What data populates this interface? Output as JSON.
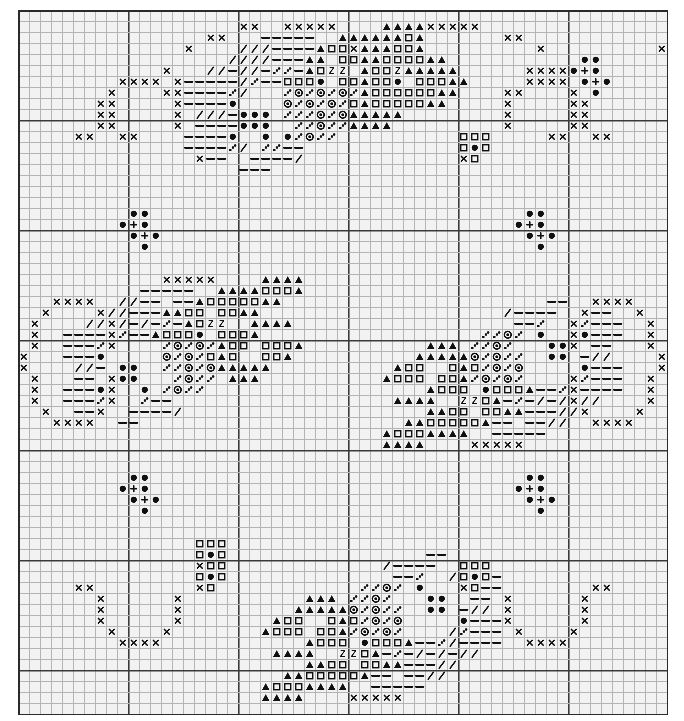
{
  "document": {
    "type": "cross-stitch-pattern-chart",
    "title": "Cross Stitch Pattern Chart",
    "description": "Monochrome counted cross stitch grid chart with four-fold symmetric rose and berry motifs"
  },
  "grid": {
    "columns": 59,
    "rows": 64,
    "cell_px": 11,
    "origin_x_px": 18,
    "origin_y_px": 10,
    "bold_every": 10,
    "background_color": "#f2f2f2",
    "thin_line_color": "#b4b4b4",
    "bold_line_color": "#3a3a3a",
    "symbol_color": "#101010",
    "border_color": "#2a2a2a"
  },
  "legend": {
    "symbols": [
      {
        "key": "x",
        "name": "cross-x-symbol",
        "glyph": "×",
        "meaning": "backstitch outline / light shade"
      },
      {
        "key": "o",
        "name": "filled-circle-symbol",
        "glyph": "●",
        "meaning": "dark berry / bud"
      },
      {
        "key": "p",
        "name": "plus-symbol",
        "glyph": "+",
        "meaning": "berry highlight"
      },
      {
        "key": "s",
        "name": "open-square-symbol",
        "glyph": "□",
        "meaning": "petal mid tone"
      },
      {
        "key": "t",
        "name": "filled-triangle-symbol",
        "glyph": "▲",
        "meaning": "petal dark tone"
      },
      {
        "key": "z",
        "name": "letter-z-symbol",
        "glyph": "Z",
        "meaning": "petal accent"
      },
      {
        "key": "d",
        "name": "dotted-circle-symbol",
        "glyph": "◎",
        "meaning": "leaf texture"
      },
      {
        "key": "q",
        "name": "quarter-dot-symbol",
        "glyph": "∴",
        "meaning": "quarter stitch"
      },
      {
        "key": "-",
        "name": "dash-symbol",
        "glyph": "—",
        "meaning": "leaf light tone"
      },
      {
        "key": "/",
        "name": "slash-symbol",
        "glyph": "/",
        "meaning": "stem / vein"
      }
    ]
  },
  "chart_data": {
    "type": "heatmap",
    "xlabel": "column",
    "ylabel": "row",
    "grid_on": true,
    "legend_position": "none",
    "columns": 59,
    "rows": 64,
    "symbol_counts": {
      "x": 196,
      "o": 120,
      "p": 16,
      "s": 132,
      "t": 176,
      "z": 8,
      "d": 96,
      "q": 120,
      "dash": 176,
      "slash": 92
    },
    "cells": [
      {
        "r": 1,
        "c": 37,
        "s": "x"
      },
      {
        "r": 1,
        "c": 38,
        "s": "x"
      },
      {
        "r": 1,
        "c": 39,
        "s": "x"
      },
      {
        "r": 1,
        "c": 40,
        "s": "x"
      },
      {
        "r": 1,
        "c": 41,
        "s": "x"
      },
      {
        "r": 1,
        "c": 20,
        "s": "x"
      },
      {
        "r": 1,
        "c": 21,
        "s": "x"
      },
      {
        "r": 2,
        "c": 23,
        "s": "-"
      },
      {
        "r": 2,
        "c": 24,
        "s": "-"
      },
      {
        "r": 2,
        "c": 25,
        "s": "-"
      },
      {
        "r": 2,
        "c": 31,
        "s": "t"
      },
      {
        "r": 2,
        "c": 32,
        "s": "t"
      },
      {
        "r": 2,
        "c": 33,
        "s": "t"
      },
      {
        "r": 2,
        "c": 34,
        "s": "t"
      },
      {
        "r": 2,
        "c": 17,
        "s": "x"
      },
      {
        "r": 2,
        "c": 18,
        "s": "x"
      },
      {
        "r": 2,
        "c": 44,
        "s": "x"
      },
      {
        "r": 2,
        "c": 45,
        "s": "x"
      },
      {
        "r": 3,
        "c": 21,
        "s": "/"
      },
      {
        "r": 3,
        "c": 22,
        "s": "/"
      },
      {
        "r": 3,
        "c": 23,
        "s": "-"
      },
      {
        "r": 3,
        "c": 24,
        "s": "-"
      },
      {
        "r": 3,
        "c": 30,
        "s": "x"
      },
      {
        "r": 3,
        "c": 31,
        "s": "t"
      },
      {
        "r": 3,
        "c": 32,
        "s": "t"
      },
      {
        "r": 3,
        "c": 33,
        "s": "t"
      },
      {
        "r": 3,
        "c": 34,
        "s": "s"
      },
      {
        "r": 3,
        "c": 35,
        "s": "s"
      },
      {
        "r": 3,
        "c": 36,
        "s": "t"
      },
      {
        "r": 3,
        "c": 15,
        "s": "x"
      },
      {
        "r": 3,
        "c": 47,
        "s": "x"
      },
      {
        "r": 4,
        "c": 21,
        "s": "/"
      },
      {
        "r": 4,
        "c": 22,
        "s": "/"
      },
      {
        "r": 4,
        "c": 23,
        "s": "-"
      },
      {
        "r": 4,
        "c": 24,
        "s": "-"
      },
      {
        "r": 4,
        "c": 25,
        "s": "-"
      },
      {
        "r": 4,
        "c": 26,
        "s": "t"
      },
      {
        "r": 4,
        "c": 27,
        "s": "t"
      },
      {
        "r": 4,
        "c": 31,
        "s": "t"
      },
      {
        "r": 4,
        "c": 32,
        "s": "t"
      },
      {
        "r": 4,
        "c": 33,
        "s": "s"
      },
      {
        "r": 4,
        "c": 34,
        "s": "s"
      },
      {
        "r": 4,
        "c": 35,
        "s": "s"
      },
      {
        "r": 4,
        "c": 36,
        "s": "s"
      },
      {
        "r": 4,
        "c": 37,
        "s": "t"
      },
      {
        "r": 4,
        "c": 38,
        "s": "t"
      },
      {
        "r": 5,
        "c": 18,
        "s": "/"
      },
      {
        "r": 5,
        "c": 19,
        "s": "-"
      },
      {
        "r": 5,
        "c": 20,
        "s": "/"
      },
      {
        "r": 5,
        "c": 21,
        "s": "/"
      },
      {
        "r": 5,
        "c": 22,
        "s": "-"
      },
      {
        "r": 5,
        "c": 23,
        "s": "q"
      },
      {
        "r": 5,
        "c": 25,
        "s": "-"
      },
      {
        "r": 5,
        "c": 31,
        "s": "t"
      },
      {
        "r": 5,
        "c": 32,
        "s": "s"
      },
      {
        "r": 5,
        "c": 33,
        "s": "s"
      },
      {
        "r": 5,
        "c": 34,
        "s": "z"
      },
      {
        "r": 5,
        "c": 36,
        "s": "t"
      },
      {
        "r": 5,
        "c": 37,
        "s": "t"
      },
      {
        "r": 5,
        "c": 38,
        "s": "t"
      },
      {
        "r": 5,
        "c": 39,
        "s": "t"
      },
      {
        "r": 6,
        "c": 16,
        "s": "-"
      },
      {
        "r": 6,
        "c": 17,
        "s": "-"
      },
      {
        "r": 6,
        "c": 18,
        "s": "-"
      },
      {
        "r": 6,
        "c": 19,
        "s": "-"
      },
      {
        "r": 6,
        "c": 20,
        "s": "/"
      },
      {
        "r": 6,
        "c": 21,
        "s": "q"
      },
      {
        "r": 6,
        "c": 22,
        "s": "-"
      },
      {
        "r": 6,
        "c": 23,
        "s": "-"
      },
      {
        "r": 6,
        "c": 31,
        "s": "t"
      },
      {
        "r": 6,
        "c": 32,
        "s": "s"
      },
      {
        "r": 6,
        "c": 33,
        "s": "s"
      },
      {
        "r": 6,
        "c": 34,
        "s": "o"
      },
      {
        "r": 6,
        "c": 36,
        "s": "s"
      },
      {
        "r": 6,
        "c": 37,
        "s": "s"
      },
      {
        "r": 6,
        "c": 38,
        "s": "s"
      },
      {
        "r": 6,
        "c": 39,
        "s": "t"
      },
      {
        "r": 6,
        "c": 40,
        "s": "t"
      },
      {
        "r": 7,
        "c": 16,
        "s": "-"
      },
      {
        "r": 7,
        "c": 17,
        "s": "-"
      },
      {
        "r": 7,
        "c": 18,
        "s": "-"
      },
      {
        "r": 7,
        "c": 19,
        "s": "q"
      },
      {
        "r": 7,
        "c": 20,
        "s": "/"
      },
      {
        "r": 7,
        "c": 26,
        "s": "q"
      },
      {
        "r": 7,
        "c": 27,
        "s": "d"
      },
      {
        "r": 7,
        "c": 28,
        "s": "q"
      },
      {
        "r": 7,
        "c": 29,
        "s": "d"
      },
      {
        "r": 7,
        "c": 30,
        "s": "q"
      },
      {
        "r": 7,
        "c": 31,
        "s": "t"
      },
      {
        "r": 7,
        "c": 32,
        "s": "s"
      },
      {
        "r": 7,
        "c": 35,
        "s": "s"
      },
      {
        "r": 7,
        "c": 36,
        "s": "s"
      },
      {
        "r": 7,
        "c": 37,
        "s": "s"
      },
      {
        "r": 7,
        "c": 38,
        "s": "t"
      },
      {
        "r": 7,
        "c": 39,
        "s": "t"
      },
      {
        "r": 8,
        "c": 16,
        "s": "-"
      },
      {
        "r": 8,
        "c": 17,
        "s": "-"
      },
      {
        "r": 8,
        "c": 18,
        "s": "-"
      },
      {
        "r": 8,
        "c": 19,
        "s": "o"
      },
      {
        "r": 8,
        "c": 26,
        "s": "d"
      },
      {
        "r": 8,
        "c": 27,
        "s": "q"
      },
      {
        "r": 8,
        "c": 28,
        "s": "d"
      },
      {
        "r": 8,
        "c": 29,
        "s": "q"
      },
      {
        "r": 8,
        "c": 30,
        "s": "s"
      },
      {
        "r": 8,
        "c": 31,
        "s": "t"
      },
      {
        "r": 8,
        "c": 32,
        "s": "s"
      },
      {
        "r": 8,
        "c": 35,
        "s": "s"
      },
      {
        "r": 8,
        "c": 36,
        "s": "s"
      },
      {
        "r": 8,
        "c": 37,
        "s": "t"
      },
      {
        "r": 8,
        "c": 38,
        "s": "t"
      },
      {
        "r": 9,
        "c": 18,
        "s": "/"
      },
      {
        "r": 9,
        "c": 19,
        "s": "-"
      },
      {
        "r": 9,
        "c": 21,
        "s": "o"
      },
      {
        "r": 9,
        "c": 22,
        "s": "o"
      },
      {
        "r": 9,
        "c": 25,
        "s": "q"
      },
      {
        "r": 9,
        "c": 26,
        "s": "q"
      },
      {
        "r": 9,
        "c": 27,
        "s": "d"
      },
      {
        "r": 9,
        "c": 28,
        "s": "q"
      },
      {
        "r": 9,
        "c": 29,
        "s": "d"
      },
      {
        "r": 9,
        "c": 30,
        "s": "t"
      },
      {
        "r": 9,
        "c": 31,
        "s": "t"
      },
      {
        "r": 9,
        "c": 32,
        "s": "t"
      },
      {
        "r": 9,
        "c": 33,
        "s": "t"
      },
      {
        "r": 9,
        "c": 34,
        "s": "t"
      },
      {
        "r": 10,
        "c": 18,
        "s": "-"
      },
      {
        "r": 10,
        "c": 19,
        "s": "-"
      },
      {
        "r": 10,
        "c": 21,
        "s": "o"
      },
      {
        "r": 10,
        "c": 22,
        "s": "o"
      },
      {
        "r": 10,
        "c": 26,
        "s": "q"
      },
      {
        "r": 10,
        "c": 27,
        "s": "d"
      },
      {
        "r": 10,
        "c": 28,
        "s": "q"
      },
      {
        "r": 10,
        "c": 29,
        "s": "q"
      },
      {
        "r": 10,
        "c": 31,
        "s": "t"
      },
      {
        "r": 10,
        "c": 32,
        "s": "t"
      },
      {
        "r": 10,
        "c": 33,
        "s": "t"
      },
      {
        "r": 11,
        "c": 16,
        "s": "-"
      },
      {
        "r": 11,
        "c": 17,
        "s": "-"
      },
      {
        "r": 11,
        "c": 18,
        "s": "-"
      },
      {
        "r": 11,
        "c": 19,
        "s": "o"
      },
      {
        "r": 11,
        "c": 24,
        "s": "o"
      },
      {
        "r": 11,
        "c": 25,
        "s": "q"
      },
      {
        "r": 11,
        "c": 26,
        "s": "d"
      },
      {
        "r": 11,
        "c": 27,
        "s": "q"
      },
      {
        "r": 11,
        "c": 28,
        "s": "q"
      },
      {
        "r": 12,
        "c": 16,
        "s": "-"
      },
      {
        "r": 12,
        "c": 17,
        "s": "-"
      },
      {
        "r": 12,
        "c": 18,
        "s": "-"
      },
      {
        "r": 12,
        "c": 19,
        "s": "q"
      },
      {
        "r": 12,
        "c": 20,
        "s": "/"
      },
      {
        "r": 12,
        "c": 23,
        "s": "q"
      },
      {
        "r": 12,
        "c": 24,
        "s": "-"
      },
      {
        "r": 12,
        "c": 25,
        "s": "-"
      },
      {
        "r": 13,
        "c": 17,
        "s": "-"
      },
      {
        "r": 13,
        "c": 18,
        "s": "-"
      },
      {
        "r": 13,
        "c": 22,
        "s": "-"
      },
      {
        "r": 13,
        "c": 23,
        "s": "-"
      },
      {
        "r": 13,
        "c": 24,
        "s": "-"
      },
      {
        "r": 13,
        "c": 25,
        "s": "/"
      },
      {
        "r": 14,
        "c": 22,
        "s": "-"
      },
      {
        "r": 6,
        "c": 9,
        "s": "x"
      },
      {
        "r": 6,
        "c": 10,
        "s": "x"
      },
      {
        "r": 6,
        "c": 11,
        "s": "x"
      },
      {
        "r": 6,
        "c": 12,
        "s": "x"
      },
      {
        "r": 5,
        "c": 46,
        "s": "x"
      },
      {
        "r": 5,
        "c": 47,
        "s": "x"
      },
      {
        "r": 5,
        "c": 48,
        "s": "x"
      },
      {
        "r": 5,
        "c": 49,
        "s": "x"
      },
      {
        "r": 7,
        "c": 8,
        "s": "x"
      },
      {
        "r": 8,
        "c": 8,
        "s": "x"
      },
      {
        "r": 9,
        "c": 8,
        "s": "x"
      },
      {
        "r": 10,
        "c": 8,
        "s": "x"
      },
      {
        "r": 11,
        "c": 9,
        "s": "x"
      },
      {
        "r": 11,
        "c": 10,
        "s": "x"
      },
      {
        "r": 7,
        "c": 50,
        "s": "x"
      },
      {
        "r": 8,
        "c": 50,
        "s": "x"
      },
      {
        "r": 9,
        "c": 50,
        "s": "x"
      },
      {
        "r": 10,
        "c": 50,
        "s": "x"
      },
      {
        "r": 11,
        "c": 48,
        "s": "x"
      },
      {
        "r": 11,
        "c": 49,
        "s": "x"
      },
      {
        "r": 7,
        "c": 14,
        "s": "x"
      },
      {
        "r": 8,
        "c": 14,
        "s": "x"
      },
      {
        "r": 9,
        "c": 14,
        "s": "x"
      },
      {
        "r": 10,
        "c": 14,
        "s": "x"
      },
      {
        "r": 6,
        "c": 14,
        "s": "x"
      },
      {
        "r": 5,
        "c": 13,
        "s": "x"
      },
      {
        "r": 7,
        "c": 44,
        "s": "x"
      },
      {
        "r": 8,
        "c": 44,
        "s": "x"
      },
      {
        "r": 9,
        "c": 44,
        "s": "x"
      },
      {
        "r": 10,
        "c": 44,
        "s": "x"
      },
      {
        "r": 8,
        "c": 17,
        "s": "-"
      },
      {
        "r": 3,
        "c": 58,
        "s": "x"
      },
      {
        "r": 0,
        "c": 0,
        "s": ""
      }
    ]
  }
}
